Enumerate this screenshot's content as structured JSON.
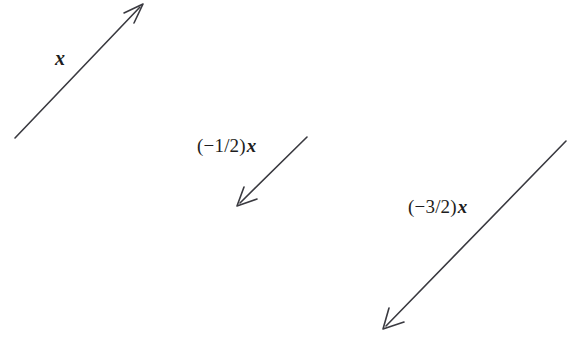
{
  "figure": {
    "width": 584,
    "height": 341,
    "background_color": "#ffffff",
    "stroke_color": "#3a3a40",
    "text_color": "#1d1d20",
    "stroke_width": 1.6
  },
  "vectors": [
    {
      "id": "x",
      "label_prefix": "",
      "label_variable": "x",
      "label_full": "x",
      "scalar": 1,
      "direction": "up-right",
      "tail": {
        "x": 15,
        "y": 138
      },
      "tip": {
        "x": 143,
        "y": 4
      },
      "label_position": {
        "x": 54,
        "y": 48
      }
    },
    {
      "id": "neg-half-x",
      "label_prefix": "(−1/2)",
      "label_variable": "x",
      "label_full": "(−1/2)x",
      "scalar": -0.5,
      "direction": "down-left",
      "tail": {
        "x": 307,
        "y": 137
      },
      "tip": {
        "x": 237,
        "y": 206
      },
      "label_position": {
        "x": 197,
        "y": 136
      }
    },
    {
      "id": "neg-three-halves-x",
      "label_prefix": "(−3/2)",
      "label_variable": "x",
      "label_full": "(−3/2)x",
      "scalar": -1.5,
      "direction": "down-left",
      "tail": {
        "x": 566,
        "y": 141
      },
      "tip": {
        "x": 383,
        "y": 329
      },
      "label_position": {
        "x": 408,
        "y": 197
      }
    }
  ]
}
